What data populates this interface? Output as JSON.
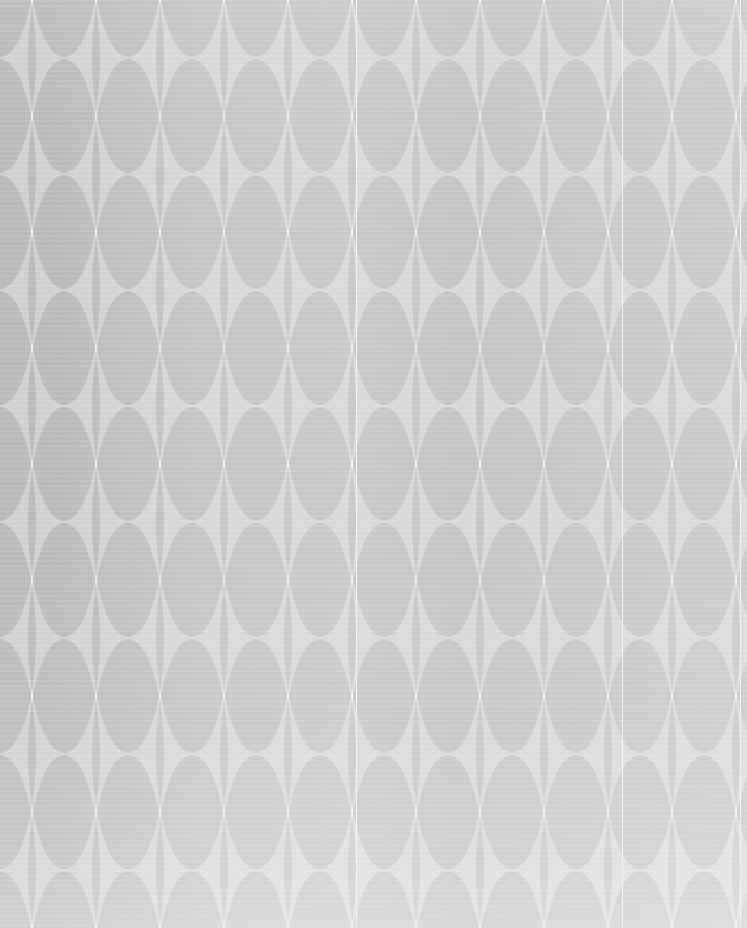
{
  "image": {
    "kind": "seamless-pattern",
    "subject": "overlapping-ellipse-lattice",
    "width": 747,
    "height": 928,
    "caption": "Seamless repeating pattern of translucent grey ellipses on a white ground"
  },
  "palette": {
    "background": "#ffffff",
    "ellipse_fill": "#a9a9a9",
    "ellipse_overlap": "#9a9a9a",
    "highlight_white": "#ffffff",
    "haze_white": "#fdfdfd",
    "seam_line": "#f2f2f2"
  },
  "pattern": {
    "shape": "ellipse",
    "ellipse_width": 72,
    "ellipse_height": 230,
    "tile_width": 64,
    "tile_height": 116,
    "columns": 13,
    "rows": 10,
    "fill_opacity": 0.52,
    "row_offset_x": 0,
    "overlap_mode": "multiply",
    "negative_space": "four-pointed-star"
  },
  "effects": {
    "haze_horizontal_label": "edge-to-centre white wash",
    "haze_vertical_label": "bottom white fade",
    "weave_label": "fine horizontal weave texture",
    "seam_positions": [
      356,
      622,
      740
    ]
  }
}
